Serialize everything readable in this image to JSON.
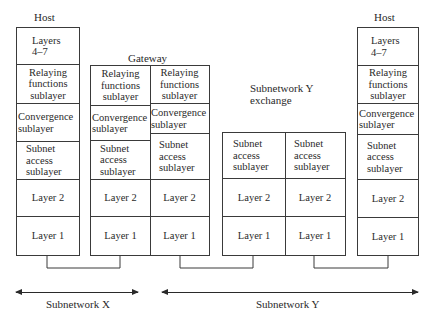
{
  "diagram": {
    "host_left": {
      "title": "Host",
      "layers": [
        "Layers\n4–7",
        "Relaying\nfunctions\nsublayer",
        "Convergence\nsublayer",
        "Subnet\naccess\nsublayer",
        "Layer 2",
        "Layer 1"
      ]
    },
    "gateway": {
      "title": "Gateway",
      "left_column": [
        "Relaying\nfunctions\nsublayer",
        "Convergence\nsublayer",
        "Subnet\naccess\nsublayer",
        "Layer 2",
        "Layer 1"
      ],
      "right_column": [
        "Relaying\nfunctions\nsublayer",
        "Convergence\nsublayer",
        "Subnet\naccess\nsublayer",
        "Layer 2",
        "Layer 1"
      ]
    },
    "exchange": {
      "title": "Subnetwork Y\nexchange",
      "left_column": [
        "Subnet\naccess\nsublayer",
        "Layer 2",
        "Layer 1"
      ],
      "right_column": [
        "Subnet\naccess\nsublayer",
        "Layer 2",
        "Layer 1"
      ]
    },
    "host_right": {
      "title": "Host",
      "layers": [
        "Layers\n4–7",
        "Relaying\nfunctions\nsublayer",
        "Convergence\nsublayer",
        "Subnet\naccess\nsublayer",
        "Layer 2",
        "Layer 1"
      ]
    },
    "spans": {
      "subnetwork_x": "Subnetwork X",
      "subnetwork_y": "Subnetwork Y"
    },
    "colors": {
      "line": "#3a3a3a",
      "text": "#2a2a2a",
      "background": "#ffffff"
    }
  }
}
